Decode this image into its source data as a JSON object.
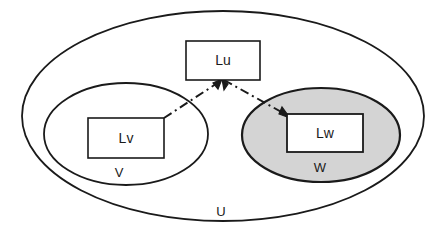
{
  "diagram": {
    "type": "set-containment-diagram",
    "background_color": "#ffffff",
    "stroke_color": "#1a1a1a",
    "sets": [
      {
        "id": "U",
        "label": "U",
        "shape": "ellipse",
        "fill": "#ffffff",
        "label_x": 221,
        "label_y": 213,
        "cx": 223,
        "cy": 116,
        "rx": 201,
        "ry": 105
      },
      {
        "id": "V",
        "label": "V",
        "shape": "ellipse",
        "fill": "#ffffff",
        "label_x": 119,
        "label_y": 174,
        "cx": 126,
        "cy": 134,
        "rx": 82,
        "ry": 51
      },
      {
        "id": "W",
        "label": "W",
        "shape": "ellipse",
        "fill": "#d4d4d4",
        "label_x": 320,
        "label_y": 169,
        "cx": 321,
        "cy": 135,
        "rx": 79,
        "ry": 47
      }
    ],
    "boxes": [
      {
        "id": "Lu",
        "label": "Lu",
        "fill": "#ffffff",
        "x": 186,
        "y": 41,
        "width": 74,
        "height": 39
      },
      {
        "id": "Lv",
        "label": "Lv",
        "fill": "#ffffff",
        "x": 88,
        "y": 118,
        "width": 76,
        "height": 40
      },
      {
        "id": "Lw",
        "label": "Lw",
        "fill": "#ffffff",
        "x": 287,
        "y": 114,
        "width": 76,
        "height": 38
      }
    ],
    "arrows": [
      {
        "id": "lv-to-lu",
        "from": "Lv",
        "to": "Lu",
        "style": "dash-dot",
        "x1": 164,
        "y1": 118,
        "x2": 222,
        "y2": 80,
        "arrowhead_at": "end"
      },
      {
        "id": "lu-to-lw",
        "from": "Lu",
        "to": "Lw",
        "style": "dash-dot",
        "x1": 224,
        "y1": 80,
        "x2": 289,
        "y2": 117,
        "arrowhead_at": "end"
      }
    ]
  }
}
